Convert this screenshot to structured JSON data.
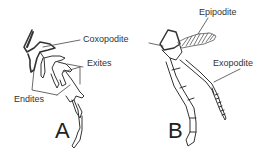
{
  "figure": {
    "panel_a": {
      "letter": "A",
      "labels": {
        "coxopodite": "Coxopodite",
        "exites": "Exites",
        "endites": "Endites"
      }
    },
    "panel_b": {
      "letter": "B",
      "labels": {
        "epipodite": "Epipodite",
        "exopodite": "Exopodite"
      }
    },
    "colors": {
      "line": "#333333",
      "background": "#ffffff"
    }
  }
}
